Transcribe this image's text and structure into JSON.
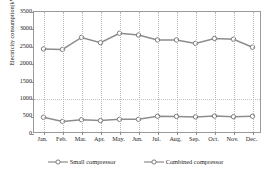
{
  "chart_data": {
    "type": "line",
    "title": "",
    "xlabel": "",
    "ylabel": "Electricity consumption(kWh)",
    "categories": [
      "Jan.",
      "Feb.",
      "Mar.",
      "Apr.",
      "May.",
      "Jun.",
      "Jul.",
      "Aug.",
      "Sep.",
      "Oct.",
      "Nov.",
      "Dec."
    ],
    "series": [
      {
        "name": "Small compressor",
        "marker": "open-circle",
        "color": "#8d8d8d",
        "values": [
          480,
          360,
          410,
          385,
          420,
          420,
          510,
          505,
          490,
          515,
          495,
          510
        ]
      },
      {
        "name": "Combined compressor",
        "marker": "open-circle",
        "color": "#8d8d8d",
        "values": [
          2440,
          2425,
          2770,
          2620,
          2890,
          2840,
          2700,
          2700,
          2600,
          2740,
          2720,
          2490
        ]
      }
    ],
    "ylim": [
      0,
      3500
    ],
    "yticks": [
      0,
      500,
      1000,
      1500,
      2000,
      2500,
      3000,
      3500
    ],
    "ytick_labels": [
      "0",
      "500",
      "1000",
      "1500",
      "2000",
      "2500",
      "3000",
      "3500"
    ],
    "grid": "dotted-vertical-and-horizontal",
    "legend_position": "bottom-center"
  },
  "legend": {
    "items": [
      {
        "label": "Small compressor"
      },
      {
        "label": "Combined compressor"
      }
    ]
  }
}
